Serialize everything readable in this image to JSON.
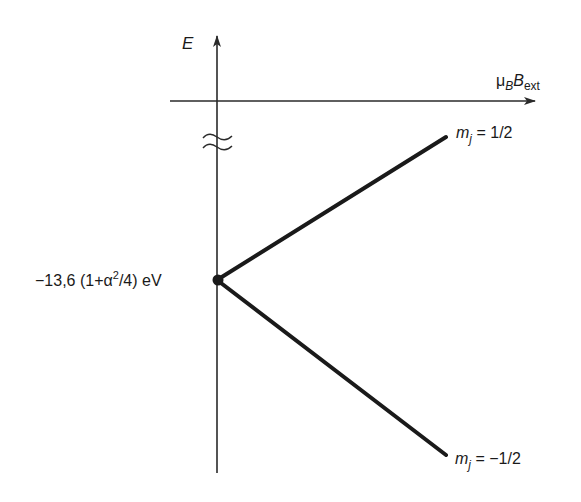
{
  "diagram": {
    "type": "energy-level Zeeman splitting diagram",
    "axes": {
      "y_label": "E",
      "x_label_main": "μ",
      "x_label_sub1": "B",
      "x_label_main2": "B",
      "x_label_sub2": "ext"
    },
    "origin_label": {
      "prefix": "−13,6 (1+α",
      "sup": "2",
      "suffix": "/4) eV"
    },
    "levels": [
      {
        "name": "upper",
        "m_label": "m",
        "m_sub": "j",
        "value_text": " = 1/2"
      },
      {
        "name": "lower",
        "m_label": "m",
        "m_sub": "j",
        "value_text": " = −1/2"
      }
    ],
    "axis_break_symbol": "≈",
    "colors": {
      "line": "#1a1a1a",
      "axis": "#2a2a2a",
      "background": "#ffffff"
    }
  }
}
